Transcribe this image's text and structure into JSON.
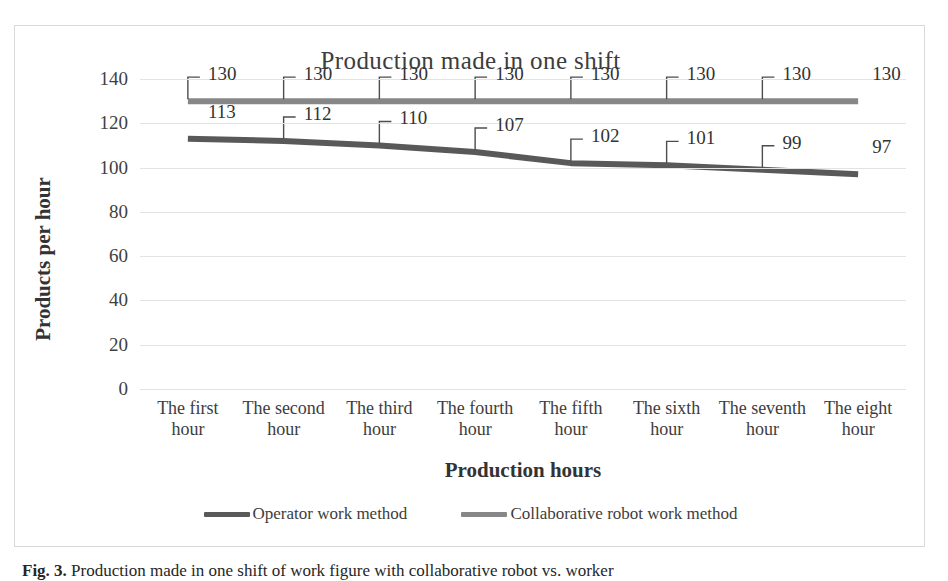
{
  "chart_data": {
    "type": "line",
    "title": "Production made in one shift",
    "xlabel": "Production hours",
    "ylabel": "Products per hour",
    "ylim": [
      0,
      140
    ],
    "ytick_step": 20,
    "yticks": [
      "140",
      "120",
      "100",
      "80",
      "60",
      "40",
      "20",
      "0"
    ],
    "grid": true,
    "legend_position": "bottom",
    "categories": [
      "The first hour",
      "The second hour",
      "The third hour",
      "The fourth hour",
      "The fifth hour",
      "The sixth hour",
      "The seventh hour",
      "The eight hour"
    ],
    "categories_wrapped": [
      [
        "The first",
        "hour"
      ],
      [
        "The second",
        "hour"
      ],
      [
        "The third",
        "hour"
      ],
      [
        "The fourth",
        "hour"
      ],
      [
        "The fifth",
        "hour"
      ],
      [
        "The sixth",
        "hour"
      ],
      [
        "The seventh",
        "hour"
      ],
      [
        "The eight",
        "hour"
      ]
    ],
    "series": [
      {
        "name": "Operator work method",
        "color": "#595959",
        "values": [
          113,
          112,
          110,
          107,
          102,
          101,
          99,
          97
        ]
      },
      {
        "name": "Collaborative robot work method",
        "color": "#878787",
        "values": [
          130,
          130,
          130,
          130,
          130,
          130,
          130,
          130
        ]
      }
    ]
  },
  "caption": {
    "lead": "Fig. 3.",
    "text": "Production made in one shift of work figure with collaborative robot vs. worker"
  }
}
